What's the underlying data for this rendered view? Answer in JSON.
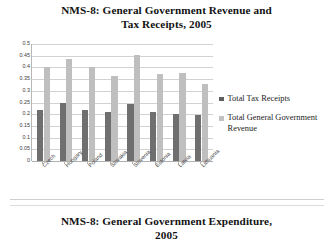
{
  "figure_top": {
    "title_line1": "NMS-8:  General Government Revenue and",
    "title_line2": "Tax Receipts, 2005"
  },
  "figure_bottom": {
    "title_line1": "NMS-8:  General Government Expenditure,",
    "title_line2": "2005"
  },
  "legend": {
    "entries": [
      {
        "label": "Total Tax Receipts",
        "color": "#5f5f5f"
      },
      {
        "label": "Total General Government Revenue",
        "color": "#c2c2c2"
      }
    ]
  },
  "axis": {
    "yticks": [
      "0.5",
      "0.45",
      "0.4",
      "0.35",
      "0.3",
      "0.25",
      "0.2",
      "0.15",
      "0.1",
      "0.05",
      "0"
    ],
    "ytick_values": [
      0.5,
      0.45,
      0.4,
      0.35,
      0.3,
      0.25,
      0.2,
      0.15,
      0.1,
      0.05,
      0
    ]
  },
  "chart_data": {
    "type": "bar",
    "title": "NMS-8:  General Government Revenue and Tax Receipts, 2005",
    "xlabel": "",
    "ylabel": "",
    "ylim": [
      0,
      0.5
    ],
    "ytick_step": 0.05,
    "grid": true,
    "legend_position": "right",
    "categories": [
      "Czech",
      "Hungary",
      "Poland",
      "Slovakia",
      "Slovenia",
      "Estonia",
      "Latvia",
      "Lithuania"
    ],
    "series": [
      {
        "name": "Total Tax Receipts",
        "color": "#6f6f6f",
        "values": [
          0.22,
          0.25,
          0.22,
          0.21,
          0.245,
          0.21,
          0.2,
          0.195
        ]
      },
      {
        "name": "Total General Government Revenue",
        "color": "#bfbfbf",
        "values": [
          0.4,
          0.435,
          0.4,
          0.365,
          0.455,
          0.37,
          0.375,
          0.33
        ]
      }
    ]
  }
}
